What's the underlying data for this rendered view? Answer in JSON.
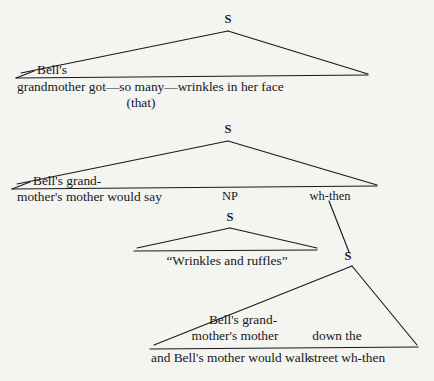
{
  "figure": {
    "type": "syntactic-tree-diagram",
    "background_color": "#f4f4f1",
    "line_color": "#1a1a1e",
    "text_color": "#17171a"
  },
  "trees": [
    {
      "id": "tree-1",
      "root_label": "S",
      "terminal_lines": [
        "Bell's",
        "grandmother got—so many—wrinkles in her face",
        "(that)"
      ]
    },
    {
      "id": "tree-2",
      "root_label": "S",
      "terminal_lines": [
        "Bell's grand-",
        "mother's mother would say"
      ],
      "inner_nodes": [
        "NP",
        "wh-then"
      ]
    },
    {
      "id": "tree-3",
      "root_label": "S",
      "terminal_lines": [
        "“Wrinkles and ruffles”"
      ]
    },
    {
      "id": "tree-4",
      "root_label": "S",
      "terminal_lines": [
        "Bell's grand-",
        "mother's mother",
        "and Bell's mother would walk",
        "down the",
        "street wh-then"
      ]
    }
  ],
  "labels": {
    "s1_root": "S",
    "s1_bells": "Bell's",
    "s1_line": "grandmother got—so many—wrinkles in her face",
    "s1_that": "(that)",
    "s2_root": "S",
    "s2_bells_grand": "Bell's grand-",
    "s2_line": "mother's mother would say",
    "s2_np": "NP",
    "s2_whthen": "wh-then",
    "s3_root": "S",
    "s3_line": "“Wrinkles and ruffles”",
    "s4_root": "S",
    "s4_bells_grand": "Bell's grand-",
    "s4_mothers_mother": "mother's mother",
    "s4_line_bottom": "and Bell's mother would walk",
    "s4_down_the": "down the",
    "s4_street_whthen": "street wh-then"
  }
}
